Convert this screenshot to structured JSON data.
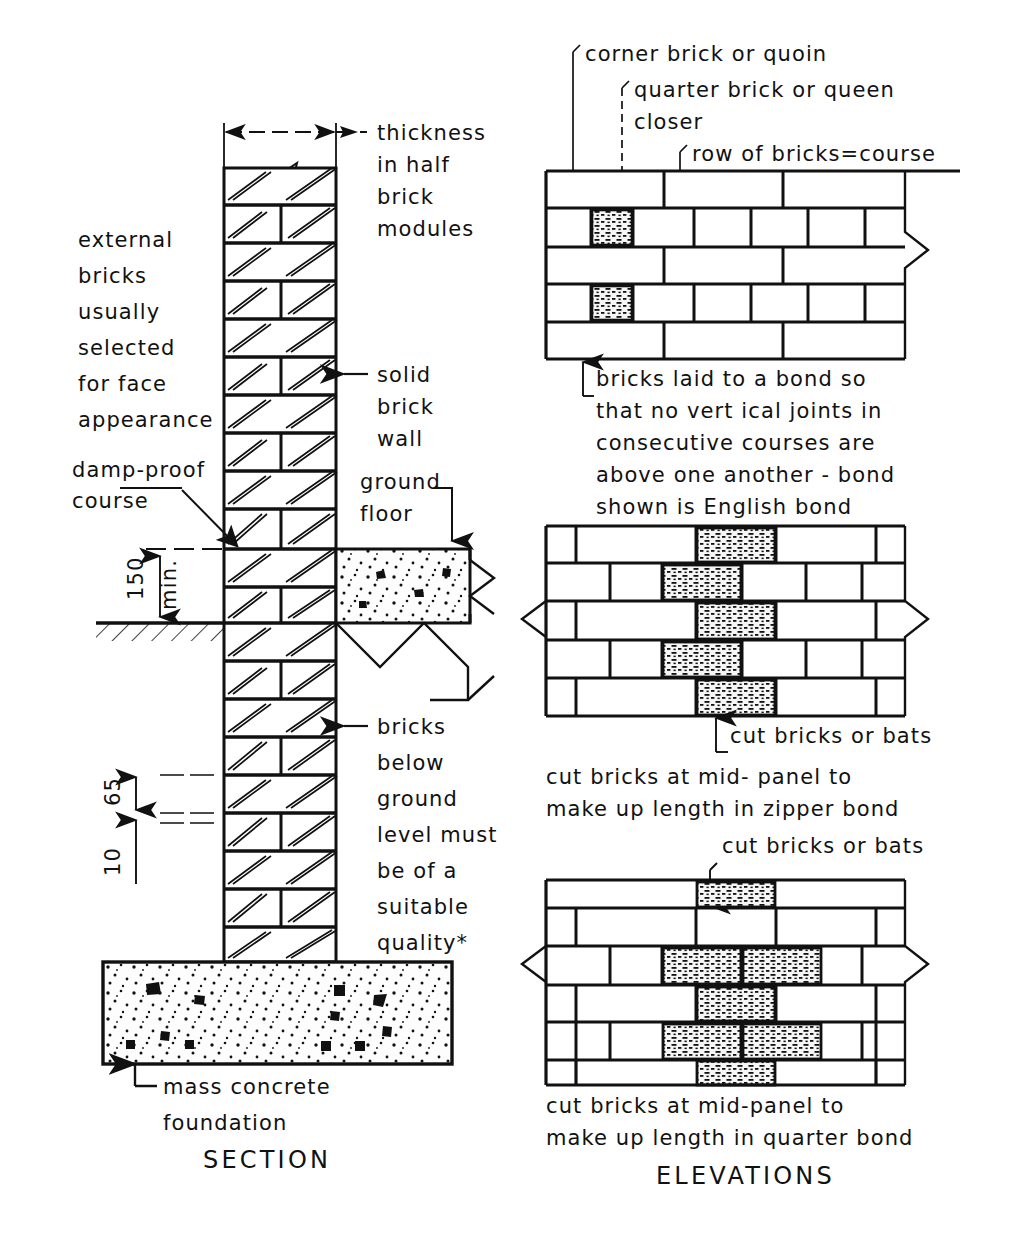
{
  "figure": {
    "title_section": "SECTION",
    "title_elevations": "ELEVATIONS"
  },
  "section_view": {
    "labels": {
      "thickness": [
        "thickness",
        "in  half",
        "brick",
        "modules"
      ],
      "external_bricks": [
        "external",
        "bricks",
        "usually",
        "selected",
        "for face",
        "appearance"
      ],
      "solid_brick_wall": [
        "solid",
        "brick",
        "wall"
      ],
      "damp_proof_course": [
        "damp-proof",
        "course"
      ],
      "ground_floor": [
        "ground",
        "floor"
      ],
      "bricks_below_ground": [
        "bricks",
        "below",
        "ground",
        "level must",
        "be of a",
        "suitable",
        "quality*"
      ],
      "mass_concrete_foundation": [
        "mass concrete",
        "foundation"
      ]
    },
    "dimensions": [
      {
        "value": "150",
        "qualifier": "min.",
        "name": "dpc-height-above-ground"
      },
      {
        "value": "65",
        "qualifier": "",
        "name": "brick-height"
      },
      {
        "value": "10",
        "qualifier": "",
        "name": "joint-thickness"
      }
    ]
  },
  "elevation_views": [
    {
      "name": "english-bond",
      "callouts": [
        "corner brick or  quoin",
        "quarter brick  or queen",
        "closer",
        "row of bricks=course"
      ],
      "note": [
        "bricks  laid  to  a  bond so",
        "that  no vert ical  joints in",
        "consecutive  courses  are",
        "above  one another - bond",
        "shown is English  bond"
      ]
    },
    {
      "name": "zipper-bond",
      "callouts": [
        "cut  bricks or bats"
      ],
      "note": [
        "cut  bricks at  mid- panel to",
        "make up  length  in zipper bond"
      ]
    },
    {
      "name": "quarter-bond",
      "callouts": [
        "cut bricks or bats"
      ],
      "note": [
        "cut  bricks at  mid-panel to",
        "make up  length in  quarter bond"
      ]
    }
  ],
  "colors": {
    "ink": "#111111",
    "paper": "#ffffff",
    "concrete_fill": "#fbfbfb",
    "cut_brick_fill": "#f4f4f4"
  }
}
